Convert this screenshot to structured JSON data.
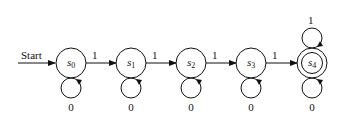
{
  "diagram": {
    "type": "finite-state-machine",
    "start_label": "Start",
    "states": [
      {
        "id": "s0",
        "name": "s",
        "subscript": "0",
        "accepting": false,
        "self_loop_label": "0",
        "loop_side": "bottom"
      },
      {
        "id": "s1",
        "name": "s",
        "subscript": "1",
        "accepting": false,
        "self_loop_label": "0",
        "loop_side": "bottom"
      },
      {
        "id": "s2",
        "name": "s",
        "subscript": "2",
        "accepting": false,
        "self_loop_label": "0",
        "loop_side": "bottom"
      },
      {
        "id": "s3",
        "name": "s",
        "subscript": "3",
        "accepting": false,
        "self_loop_label": "0",
        "loop_side": "bottom"
      },
      {
        "id": "s4",
        "name": "s",
        "subscript": "4",
        "accepting": true,
        "self_loop_label": "0",
        "loop_side": "bottom",
        "top_loop_label": "1"
      }
    ],
    "transitions": [
      {
        "from": "s0",
        "to": "s1",
        "label": "1"
      },
      {
        "from": "s1",
        "to": "s2",
        "label": "1"
      },
      {
        "from": "s2",
        "to": "s3",
        "label": "1"
      },
      {
        "from": "s3",
        "to": "s4",
        "label": "1"
      }
    ]
  }
}
